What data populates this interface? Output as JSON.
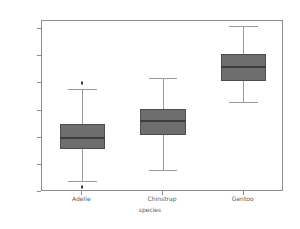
{
  "chart_data": {
    "type": "box",
    "title": "",
    "xlabel": "species",
    "ylabel": "flipper_length_mm",
    "categories": [
      "Adelie",
      "Chinstrap",
      "Gentoo"
    ],
    "ylim": [
      170,
      233
    ],
    "yticks": [
      170,
      180,
      190,
      200,
      210,
      220,
      230
    ],
    "ytick_labels": [
      "170",
      "180",
      "190",
      "200",
      "210",
      "220",
      "230"
    ],
    "grid": false,
    "legend": null,
    "box_color": "#6e6e6e",
    "edge_color": "#4d4d4d",
    "whisker_color": "#9a9a9a",
    "median_color": "#3d3d3d",
    "boxes": [
      {
        "label": "Adelie",
        "whisker_low": 174,
        "q1": 186,
        "median": 190,
        "q3": 195,
        "whisker_high": 208,
        "fliers": [
          210,
          172
        ]
      },
      {
        "label": "Chinstrap",
        "whisker_low": 178,
        "q1": 191,
        "median": 196,
        "q3": 200.5,
        "whisker_high": 212,
        "fliers": []
      },
      {
        "label": "Gentoo",
        "whisker_low": 203,
        "q1": 211,
        "median": 216,
        "q3": 221,
        "whisker_high": 231,
        "fliers": []
      }
    ]
  }
}
